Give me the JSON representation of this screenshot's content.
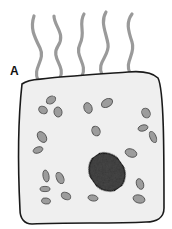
{
  "figure": {
    "label": "A",
    "colors": {
      "background": "#ffffff",
      "cytoplasm": "#efefef",
      "outline": "#1a1a1a",
      "flagella": "#9a9a9a",
      "organelle_fill": "#9c9c9c",
      "organelle_stroke": "#555555",
      "nucleus_fill": "#4a4a4a"
    },
    "flagella_count": 5,
    "organelle_count": 21,
    "nucleus": {
      "present": true
    }
  }
}
